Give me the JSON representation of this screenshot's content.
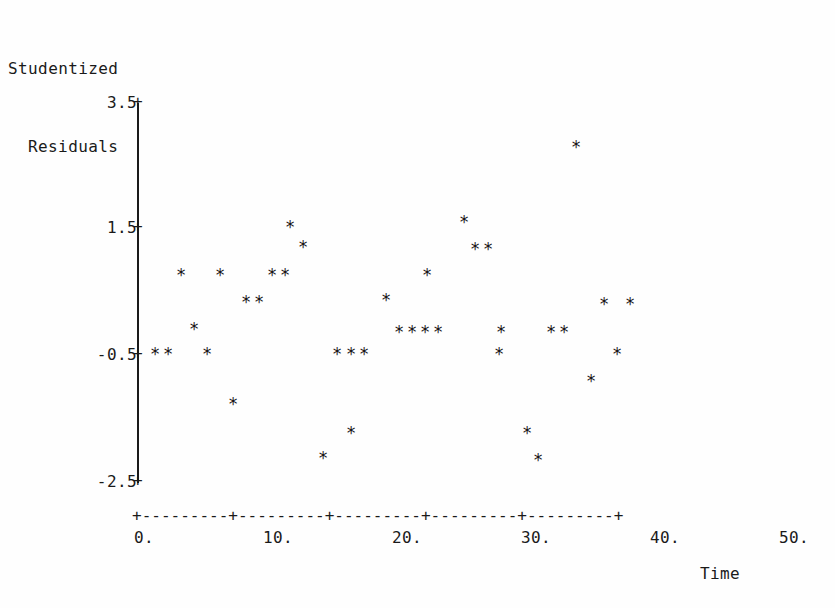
{
  "title": {
    "line1": "Studentized",
    "line2": "Residuals"
  },
  "axes": {
    "x_title": "Time",
    "y_tick_labels": [
      "3.5",
      "1.5",
      "-0.5",
      "-2.5"
    ],
    "x_tick_labels": [
      "0.",
      "10.",
      "20.",
      "30.",
      "40.",
      "50."
    ],
    "tick_marker": "+",
    "axis_rule": "+---------+---------+---------+---------+---------+",
    "point_marker": "*"
  },
  "chart_data": {
    "type": "scatter",
    "title": "Studentized Residuals",
    "xlabel": "Time",
    "ylabel": "Studentized Residuals",
    "xlim": [
      0,
      50
    ],
    "ylim": [
      -2.5,
      3.5
    ],
    "xticks": [
      0,
      10,
      20,
      30,
      40,
      50
    ],
    "yticks": [
      -2.5,
      -0.5,
      1.5,
      3.5
    ],
    "grid": false,
    "legend": null,
    "marker": "*",
    "n_points": 41,
    "points": [
      {
        "x": 1.3,
        "y": -0.5
      },
      {
        "x": 2.3,
        "y": -0.5
      },
      {
        "x": 3.3,
        "y": 0.74
      },
      {
        "x": 4.2,
        "y": -0.12
      },
      {
        "x": 5.2,
        "y": -0.5
      },
      {
        "x": 6.2,
        "y": 0.74
      },
      {
        "x": 7.3,
        "y": -1.29
      },
      {
        "x": 8.3,
        "y": 0.33
      },
      {
        "x": 9.3,
        "y": 0.33
      },
      {
        "x": 10.3,
        "y": 0.74
      },
      {
        "x": 11.3,
        "y": 0.74
      },
      {
        "x": 11.9,
        "y": 1.5
      },
      {
        "x": 12.9,
        "y": 1.18
      },
      {
        "x": 13.9,
        "y": -0.5
      },
      {
        "x": 14.3,
        "y": -2.14
      },
      {
        "x": 15.0,
        "y": -0.5
      },
      {
        "x": 16.0,
        "y": -0.5
      },
      {
        "x": 16.5,
        "y": -1.74
      },
      {
        "x": 18.9,
        "y": 0.35
      },
      {
        "x": 20.2,
        "y": -0.18
      },
      {
        "x": 21.1,
        "y": -0.18
      },
      {
        "x": 22.3,
        "y": -0.18
      },
      {
        "x": 23.2,
        "y": -0.18
      },
      {
        "x": 23.0,
        "y": 0.74
      },
      {
        "x": 25.3,
        "y": 1.58
      },
      {
        "x": 26.1,
        "y": 1.15
      },
      {
        "x": 27.1,
        "y": 1.15
      },
      {
        "x": 27.8,
        "y": -0.18
      },
      {
        "x": 28.0,
        "y": -0.5
      },
      {
        "x": 29.9,
        "y": -0.18
      },
      {
        "x": 30.2,
        "y": -1.74
      },
      {
        "x": 30.9,
        "y": -0.18
      },
      {
        "x": 31.0,
        "y": -2.17
      },
      {
        "x": 34.0,
        "y": 2.76
      },
      {
        "x": 34.9,
        "y": -0.95
      },
      {
        "x": 36.1,
        "y": 0.29
      },
      {
        "x": 36.8,
        "y": -0.5
      },
      {
        "x": 38.1,
        "y": 0.29
      }
    ]
  },
  "point_pixels": [
    {
      "px": 155,
      "py": 355
    },
    {
      "px": 168,
      "py": 355
    },
    {
      "px": 181,
      "py": 276
    },
    {
      "px": 194,
      "py": 330
    },
    {
      "px": 207,
      "py": 355
    },
    {
      "px": 220,
      "py": 276
    },
    {
      "px": 233,
      "py": 405
    },
    {
      "px": 246,
      "py": 303
    },
    {
      "px": 259,
      "py": 303
    },
    {
      "px": 272,
      "py": 276
    },
    {
      "px": 285,
      "py": 276
    },
    {
      "px": 290,
      "py": 228
    },
    {
      "px": 303,
      "py": 248
    },
    {
      "px": 337,
      "py": 355
    },
    {
      "px": 323,
      "py": 459
    },
    {
      "px": 351,
      "py": 355
    },
    {
      "px": 364,
      "py": 355
    },
    {
      "px": 351,
      "py": 434
    },
    {
      "px": 386,
      "py": 301
    },
    {
      "px": 399,
      "py": 333
    },
    {
      "px": 412,
      "py": 333
    },
    {
      "px": 425,
      "py": 333
    },
    {
      "px": 438,
      "py": 333
    },
    {
      "px": 427,
      "py": 276
    },
    {
      "px": 464,
      "py": 223
    },
    {
      "px": 475,
      "py": 250
    },
    {
      "px": 488,
      "py": 250
    },
    {
      "px": 501,
      "py": 333
    },
    {
      "px": 499,
      "py": 355
    },
    {
      "px": 551,
      "py": 333
    },
    {
      "px": 527,
      "py": 434
    },
    {
      "px": 564,
      "py": 333
    },
    {
      "px": 538,
      "py": 461
    },
    {
      "px": 576,
      "py": 148
    },
    {
      "px": 591,
      "py": 382
    },
    {
      "px": 604,
      "py": 305
    },
    {
      "px": 617,
      "py": 355
    },
    {
      "px": 630,
      "py": 305
    }
  ],
  "axis_pixels": {
    "x0_px": 138,
    "px_per_x_unit": 12.9,
    "y_top_px": 103,
    "y_top_value": 3.5,
    "px_per_y_unit": 63.5
  },
  "y_tick_pixels": [
    103,
    228,
    355,
    482
  ],
  "x_tick_pixels": [
    138,
    267,
    396,
    525,
    654,
    783
  ]
}
